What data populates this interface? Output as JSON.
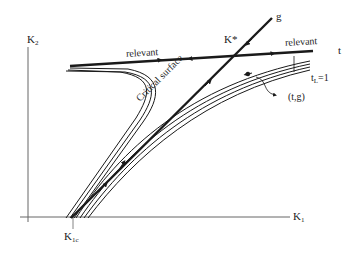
{
  "diagram": {
    "type": "renormalization-group-flow",
    "axes": {
      "x_label": "K",
      "x_sub": "1",
      "y_label": "K",
      "y_sub": "2"
    },
    "labels": {
      "fixed_point": "K*",
      "g_axis": "g",
      "t_axis": "t",
      "relevant_left": "relevant",
      "relevant_right": "relevant",
      "critical_surface": "Critical surface",
      "tl_main": "t",
      "tl_sub": "L",
      "tl_eq": "=1",
      "tg_point": "(t,g)",
      "k1c_main": "K",
      "k1c_sub": "1c"
    },
    "colors": {
      "line": "#1a1a1a",
      "axis": "#555555",
      "background": "#ffffff"
    }
  }
}
